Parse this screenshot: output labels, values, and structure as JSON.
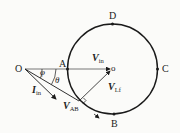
{
  "diagram": {
    "type": "phasor circle diagram",
    "points": {
      "O": "O",
      "A": "A",
      "B": "B",
      "C": "C",
      "D": "D",
      "center": "o"
    },
    "angles": {
      "phi": "φ",
      "theta": "θ"
    },
    "vectors": {
      "Vin": {
        "main": "V",
        "sub": "in"
      },
      "Iin": {
        "main": "I",
        "sub": "in"
      },
      "VAB": {
        "main": "V",
        "sub": "AB"
      },
      "VLf": {
        "main": "V",
        "sub": "Lf"
      }
    },
    "colors": {
      "stroke": "#1a1a1a",
      "background": "#fbfbf9"
    }
  }
}
